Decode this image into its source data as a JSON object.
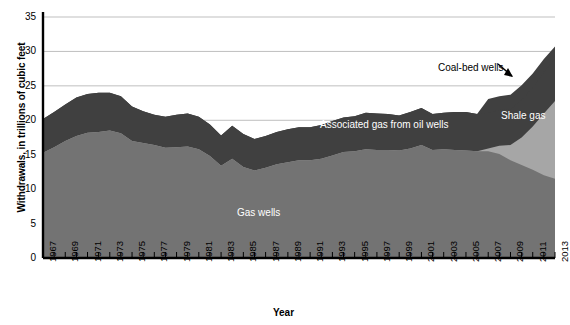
{
  "chart_data": {
    "type": "area",
    "stacked": true,
    "title": "",
    "xlabel": "Year",
    "ylabel": "Withdrawals, in trillions of cubic feet",
    "ylim": [
      0,
      35
    ],
    "ytick_step": 5,
    "yticks": [
      0,
      5,
      10,
      15,
      20,
      25,
      30,
      35
    ],
    "xlim": [
      1967,
      2013
    ],
    "xticks_labeled": [
      1967,
      1969,
      1971,
      1973,
      1975,
      1977,
      1979,
      1981,
      1983,
      1985,
      1987,
      1989,
      1991,
      1993,
      1995,
      1997,
      1999,
      2001,
      2003,
      2005,
      2007,
      2009,
      2011,
      2013
    ],
    "grid": "horizontal",
    "legend_position": "inline-labels",
    "x": [
      1967,
      1968,
      1969,
      1970,
      1971,
      1972,
      1973,
      1974,
      1975,
      1976,
      1977,
      1978,
      1979,
      1980,
      1981,
      1982,
      1983,
      1984,
      1985,
      1986,
      1987,
      1988,
      1989,
      1990,
      1991,
      1992,
      1993,
      1994,
      1995,
      1996,
      1997,
      1998,
      1999,
      2000,
      2001,
      2002,
      2003,
      2004,
      2005,
      2006,
      2007,
      2008,
      2009,
      2010,
      2011,
      2012,
      2013
    ],
    "series": [
      {
        "name": "Gas wells",
        "color": "#737373",
        "values": [
          15.3,
          16.1,
          17.0,
          17.7,
          18.2,
          18.3,
          18.5,
          18.1,
          17.0,
          16.7,
          16.4,
          16.0,
          16.1,
          16.2,
          15.8,
          14.8,
          13.4,
          14.4,
          13.2,
          12.7,
          13.1,
          13.6,
          13.9,
          14.2,
          14.2,
          14.4,
          14.9,
          15.4,
          15.5,
          15.8,
          15.7,
          15.7,
          15.6,
          15.9,
          16.4,
          15.7,
          15.8,
          15.7,
          15.6,
          15.5,
          15.5,
          15.1,
          14.2,
          13.5,
          12.8,
          12.0,
          11.5
        ]
      },
      {
        "name": "Shale gas",
        "color": "#a6a6a6",
        "values": [
          0,
          0,
          0,
          0,
          0,
          0,
          0,
          0,
          0,
          0,
          0,
          0,
          0,
          0,
          0,
          0,
          0,
          0,
          0,
          0,
          0,
          0,
          0,
          0,
          0,
          0,
          0,
          0,
          0,
          0,
          0,
          0,
          0,
          0,
          0,
          0,
          0,
          0,
          0,
          0,
          0.4,
          1.2,
          2.2,
          4.0,
          6.3,
          9.0,
          11.3
        ]
      },
      {
        "name": "Associated gas from oil wells",
        "color": "#404040",
        "values": [
          4.9,
          5.1,
          5.3,
          5.6,
          5.6,
          5.7,
          5.5,
          5.4,
          5.0,
          4.6,
          4.4,
          4.5,
          4.7,
          4.8,
          4.7,
          4.6,
          4.4,
          4.8,
          4.8,
          4.6,
          4.6,
          4.7,
          4.8,
          4.8,
          4.8,
          4.9,
          5.0,
          5.0,
          5.1,
          5.3,
          5.3,
          5.2,
          5.1,
          5.3,
          5.4,
          5.2,
          5.3,
          5.5,
          5.6,
          5.4,
          5.2,
          5.2,
          5.2,
          5.4,
          5.7,
          6.0,
          6.1
        ]
      },
      {
        "name": "Coal-bed wells",
        "color": "#404040",
        "values": [
          0,
          0,
          0,
          0,
          0,
          0,
          0,
          0,
          0,
          0,
          0,
          0,
          0,
          0,
          0,
          0,
          0,
          0,
          0,
          0,
          0,
          0,
          0,
          0,
          0,
          0,
          0,
          0,
          0,
          0,
          0,
          0,
          0,
          0,
          0,
          0,
          0,
          0,
          0,
          0,
          2.0,
          2.0,
          2.1,
          2.2,
          2.0,
          1.9,
          1.8
        ]
      }
    ],
    "annotations": [
      {
        "text": "Gas wells",
        "x_px": 237,
        "y_px": 207,
        "color": "#ffffff",
        "style": "series-label"
      },
      {
        "text": "Associated gas from oil wells",
        "x_px": 320,
        "y_px": 119,
        "color": "#ffffff",
        "style": "series-label"
      },
      {
        "text": "Shale gas",
        "x_px": 501,
        "y_px": 110,
        "color": "#ffffff",
        "style": "series-label"
      },
      {
        "text": "Coal-bed wells",
        "x_px": 438,
        "y_px": 62,
        "color": "#000000",
        "style": "callout-label"
      }
    ]
  }
}
